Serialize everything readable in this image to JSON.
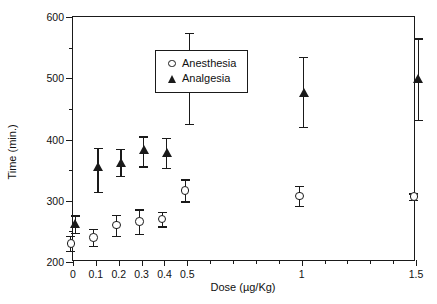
{
  "chart_data": {
    "type": "scatter",
    "title": "",
    "xlabel": "Dose (µg/Kg)",
    "ylabel": "Time (min.)",
    "xlim": [
      0,
      1.5
    ],
    "ylim": [
      200,
      600
    ],
    "grid": false,
    "legend_position": "top-left",
    "x": [
      0,
      0.1,
      0.2,
      0.3,
      0.4,
      0.5,
      1,
      1.5
    ],
    "xtick_labels": [
      "0",
      "0.1",
      "0.2",
      "0.3",
      "0.4",
      "0.5",
      "1",
      "1.5"
    ],
    "xtick_values": [
      0,
      0.1,
      0.2,
      0.3,
      0.4,
      0.5,
      1,
      1.5
    ],
    "xminor_step": 0.1,
    "ytick_labels": [
      "200",
      "300",
      "400",
      "500",
      "600"
    ],
    "ytick_values": [
      200,
      300,
      400,
      500,
      600
    ],
    "yminor_values": [
      250,
      350,
      450,
      550
    ],
    "series": [
      {
        "name": "Anesthesia",
        "marker": "open-circle",
        "values": [
          230,
          240,
          260,
          266,
          270,
          317,
          308,
          307
        ],
        "err_low": [
          12,
          14,
          17,
          20,
          12,
          18,
          16,
          5
        ],
        "err_high": [
          12,
          14,
          17,
          20,
          12,
          18,
          16,
          5
        ]
      },
      {
        "name": "Analgesia",
        "marker": "filled-triangle",
        "values": [
          262,
          355,
          362,
          383,
          378,
          497,
          477,
          500
        ],
        "err_low": [
          14,
          40,
          22,
          27,
          25,
          72,
          57,
          68
        ],
        "err_high": [
          14,
          31,
          22,
          22,
          24,
          77,
          58,
          65
        ]
      }
    ]
  },
  "legend": {
    "entries": [
      {
        "label": "Anesthesia",
        "marker": "open-circle"
      },
      {
        "label": "Analgesia",
        "marker": "filled-triangle"
      }
    ]
  }
}
